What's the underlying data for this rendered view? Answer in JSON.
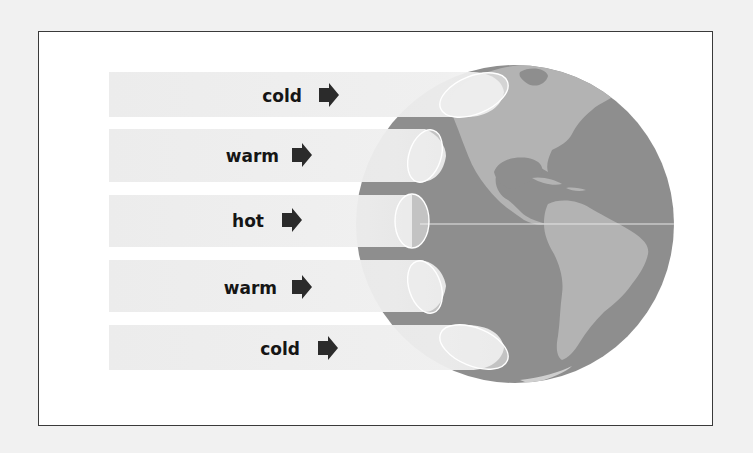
{
  "diagram": {
    "bands": [
      {
        "label": "cold",
        "zone": "northern-high-latitude"
      },
      {
        "label": "warm",
        "zone": "northern-mid-latitude"
      },
      {
        "label": "hot",
        "zone": "equator"
      },
      {
        "label": "warm",
        "zone": "southern-mid-latitude"
      },
      {
        "label": "cold",
        "zone": "southern-high-latitude"
      }
    ],
    "arrow_icon": "right-arrow-icon",
    "globe_icon": "earth-globe-americas",
    "colors": {
      "background": "#f1f1f1",
      "frame_fill": "#ffffff",
      "frame_border": "#3a3a3a",
      "band_fill": "#ececec",
      "ocean": "#8e8e8e",
      "land": "#b3b3b3",
      "text": "#151515",
      "arrow": "#2b2b2b",
      "ellipse_stroke": "#ffffff"
    }
  }
}
